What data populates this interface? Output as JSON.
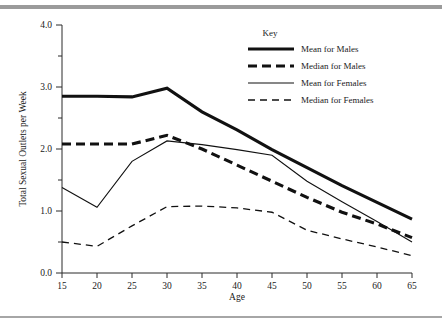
{
  "figure": {
    "background_color": "#ffffff",
    "rule_color": "#9b9b9b"
  },
  "chart_data": {
    "type": "line",
    "title": "",
    "xlabel": "Age",
    "ylabel": "Total Sexual Outlets per Week",
    "xlim": [
      15,
      65
    ],
    "ylim": [
      0.0,
      4.0
    ],
    "xticks": [
      15,
      20,
      25,
      30,
      35,
      40,
      45,
      50,
      55,
      60,
      65
    ],
    "xtick_labels": [
      "15",
      "20",
      "25",
      "30",
      "35",
      "40",
      "45",
      "50",
      "55",
      "60",
      "65"
    ],
    "yticks": [
      0.0,
      0.5,
      1.0,
      1.5,
      2.0,
      2.5,
      3.0,
      3.5,
      4.0
    ],
    "ytick_labels": [
      "0.0",
      "",
      "1.0",
      "",
      "2.0",
      "",
      "3.0",
      "",
      "4.0"
    ],
    "ytick_labels_major": [
      "0.0",
      "1.0",
      "2.0",
      "3.0",
      "4.0"
    ],
    "grid": false,
    "legend_position": "upper right",
    "legend_title": "Key",
    "x": [
      15,
      20,
      25,
      30,
      35,
      40,
      45,
      50,
      55,
      60,
      65
    ],
    "series": [
      {
        "name": "Mean for Males",
        "style": "thick-solid",
        "color": "#111111",
        "values": [
          2.85,
          2.85,
          2.84,
          2.98,
          2.6,
          2.31,
          1.99,
          1.7,
          1.41,
          1.14,
          0.87
        ]
      },
      {
        "name": "Median for Males",
        "style": "thick-dashed",
        "color": "#111111",
        "values": [
          2.08,
          2.08,
          2.08,
          2.22,
          2.0,
          1.74,
          1.48,
          1.22,
          0.98,
          0.79,
          0.57
        ]
      },
      {
        "name": "Mean for Females",
        "style": "thin-solid",
        "color": "#111111",
        "values": [
          1.38,
          1.06,
          1.8,
          2.13,
          2.07,
          1.99,
          1.9,
          1.48,
          1.15,
          0.83,
          0.5
        ]
      },
      {
        "name": "Median for Females",
        "style": "thin-dashed",
        "color": "#111111",
        "values": [
          0.5,
          0.43,
          0.76,
          1.07,
          1.08,
          1.05,
          0.98,
          0.69,
          0.55,
          0.42,
          0.28
        ]
      }
    ]
  },
  "legend": {
    "title": "Key",
    "entries": [
      {
        "label": "Mean for Males",
        "style": "thick-solid"
      },
      {
        "label": "Median for Males",
        "style": "thick-dashed"
      },
      {
        "label": "Mean for Females",
        "style": "thin-solid"
      },
      {
        "label": "Median for Females",
        "style": "thin-dashed"
      }
    ]
  }
}
